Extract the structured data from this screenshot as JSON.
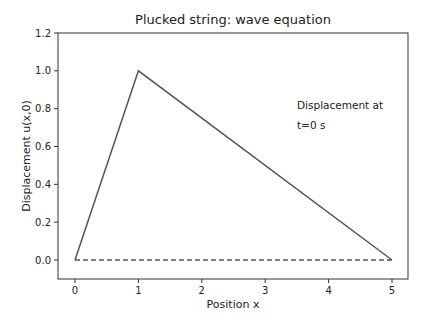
{
  "chart_data": {
    "type": "line",
    "title": "Plucked string: wave equation",
    "xlabel": "Position x",
    "ylabel": "Displacement u(x,0)",
    "xlim": [
      -0.25,
      5.25
    ],
    "ylim": [
      -0.1,
      1.2
    ],
    "xticks": [
      0,
      1,
      2,
      3,
      4,
      5
    ],
    "xtick_labels": [
      "0",
      "1",
      "2",
      "3",
      "4",
      "5"
    ],
    "yticks": [
      0.0,
      0.2,
      0.4,
      0.6,
      0.8,
      1.0,
      1.2
    ],
    "ytick_labels": [
      "0.0",
      "0.2",
      "0.4",
      "0.6",
      "0.8",
      "1.0",
      "1.2"
    ],
    "grid": false,
    "series": [
      {
        "name": "u(x,0)",
        "style": "solid",
        "color": "#555555",
        "x": [
          0,
          1,
          5
        ],
        "y": [
          0.0,
          1.0,
          0.0
        ]
      },
      {
        "name": "baseline",
        "style": "dashed",
        "color": "#555555",
        "x": [
          0,
          5
        ],
        "y": [
          0.0,
          0.0
        ]
      }
    ],
    "annotations": [
      {
        "text_line1": "Displacement at",
        "text_line2": "t=0 s",
        "x": 3.5,
        "y": 0.82
      }
    ]
  }
}
